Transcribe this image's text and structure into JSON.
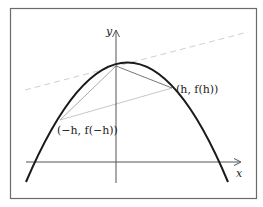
{
  "diagram": {
    "type": "function-plot",
    "axes": {
      "x_label": "x",
      "y_label": "y"
    },
    "points": {
      "right": {
        "label": "(h, f(h))"
      },
      "left": {
        "label": "(−h, f(−h))"
      }
    },
    "colors": {
      "frame": "#6b6b6b",
      "axis": "#555555",
      "curve": "#1a1a1a",
      "chord_right": "#777777",
      "chord_left": "#aaaaaa",
      "secant": "#c8c8c8",
      "dashed": "#cfcfcf"
    }
  }
}
